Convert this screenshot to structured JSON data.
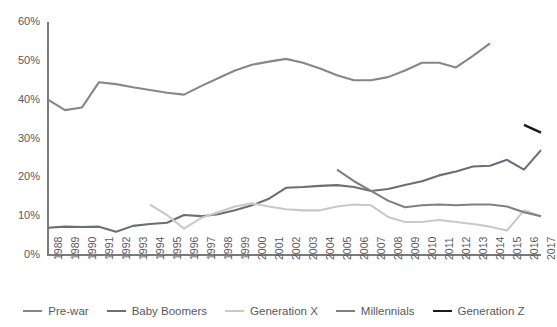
{
  "chart_data": {
    "type": "line",
    "title": "",
    "xlabel": "",
    "ylabel": "",
    "ylim": [
      0,
      60
    ],
    "yticks": [
      "0%",
      "10%",
      "20%",
      "30%",
      "40%",
      "50%",
      "60%"
    ],
    "ytick_values": [
      0,
      10,
      20,
      30,
      40,
      50,
      60
    ],
    "grid": false,
    "legend_position": "bottom",
    "x": [
      1988,
      1989,
      1990,
      1991,
      1992,
      1993,
      1994,
      1995,
      1996,
      1997,
      1998,
      1999,
      2000,
      2001,
      2002,
      2003,
      2004,
      2005,
      2006,
      2007,
      2008,
      2009,
      2010,
      2011,
      2012,
      2013,
      2014,
      2015,
      2016,
      2017
    ],
    "categories": [
      "1988",
      "1989",
      "1990",
      "1991",
      "1992",
      "1993",
      "1994",
      "1995",
      "1996",
      "1997",
      "1998",
      "1999",
      "2000",
      "2001",
      "2002",
      "2003",
      "2004",
      "2005",
      "2006",
      "2007",
      "2008",
      "2009",
      "2010",
      "2011",
      "2012",
      "2013",
      "2014",
      "2015",
      "2016",
      "2017"
    ],
    "series": [
      {
        "name": "Pre-war",
        "color": "#878787",
        "width": 2.1,
        "x": [
          1988,
          1989,
          1990,
          1991,
          1992,
          1993,
          1994,
          1995,
          1996,
          1997,
          1998,
          1999,
          2000,
          2001,
          2002,
          2003,
          2004,
          2005,
          2006,
          2007,
          2008,
          2009,
          2010,
          2011,
          2012,
          2013,
          2014
        ],
        "values": [
          40.0,
          37.3,
          38.0,
          44.5,
          44.0,
          43.2,
          42.5,
          41.8,
          41.3,
          43.5,
          45.5,
          47.5,
          49.0,
          49.8,
          50.5,
          49.5,
          48.0,
          46.3,
          45.0,
          45.0,
          45.8,
          47.5,
          49.5,
          49.5,
          48.3,
          51.3,
          54.5
        ]
      },
      {
        "name": "Baby Boomers",
        "color": "#6d6e71",
        "width": 2.1,
        "x": [
          1988,
          1989,
          1990,
          1991,
          1992,
          1993,
          1994,
          1995,
          1996,
          1997,
          1998,
          1999,
          2000,
          2001,
          2002,
          2003,
          2004,
          2005,
          2006,
          2007,
          2008,
          2009,
          2010,
          2011,
          2012,
          2013,
          2014,
          2015,
          2016,
          2017
        ],
        "values": [
          7.0,
          7.3,
          7.2,
          7.3,
          6.0,
          7.5,
          8.0,
          8.3,
          10.3,
          10.0,
          10.5,
          11.5,
          12.8,
          14.5,
          17.3,
          17.5,
          17.8,
          18.0,
          17.5,
          16.5,
          17.0,
          18.0,
          19.0,
          20.5,
          21.5,
          22.8,
          23.0,
          24.5,
          22.0,
          27.0
        ]
      },
      {
        "name": "Generation X",
        "color": "#c9c9c9",
        "width": 2.1,
        "x": [
          1994,
          1995,
          1996,
          1997,
          1998,
          1999,
          2000,
          2001,
          2002,
          2003,
          2004,
          2005,
          2006,
          2007,
          2008,
          2009,
          2010,
          2011,
          2012,
          2013,
          2014,
          2015,
          2016,
          2017
        ],
        "values": [
          13.0,
          10.3,
          6.8,
          9.5,
          11.0,
          12.5,
          13.3,
          12.5,
          11.8,
          11.5,
          11.5,
          12.5,
          13.0,
          12.8,
          9.8,
          8.5,
          8.5,
          9.0,
          8.5,
          8.0,
          7.3,
          6.3,
          11.5,
          10.0
        ]
      },
      {
        "name": "Millennials",
        "color": "#808080",
        "width": 2.1,
        "x": [
          2005,
          2006,
          2007,
          2008,
          2009,
          2010,
          2011,
          2012,
          2013,
          2014,
          2015,
          2016,
          2017
        ],
        "values": [
          22.0,
          19.0,
          16.5,
          14.0,
          12.3,
          12.8,
          13.0,
          12.8,
          13.0,
          13.0,
          12.5,
          11.0,
          10.0
        ]
      },
      {
        "name": "Generation Z",
        "color": "#1a1a1a",
        "width": 2.4,
        "x": [
          2016,
          2017
        ],
        "values": [
          33.5,
          31.5
        ]
      }
    ]
  },
  "legend": {
    "items": [
      {
        "label": "Pre-war"
      },
      {
        "label": "Baby Boomers"
      },
      {
        "label": "Generation X"
      },
      {
        "label": "Millennials"
      },
      {
        "label": "Generation Z"
      }
    ]
  }
}
